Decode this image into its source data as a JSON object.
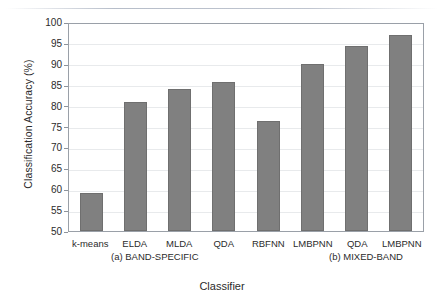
{
  "chart_data": {
    "type": "bar",
    "title": "",
    "xlabel": "Classifier",
    "ylabel": "Classification Accuracy (%)",
    "ylim": [
      50,
      100
    ],
    "ytick_step": 5,
    "yticks": [
      100,
      95,
      90,
      85,
      80,
      75,
      70,
      65,
      60,
      55,
      50
    ],
    "grid": true,
    "legend": "none",
    "bar_color": "#808080",
    "bar_edge_color": "#6f6f6f",
    "categories": [
      "k-means",
      "ELDA",
      "MLDA",
      "QDA",
      "RBFNN",
      "LMBPNN",
      "QDA",
      "LMBPNN"
    ],
    "values": [
      59.2,
      81.2,
      84.4,
      85.9,
      76.6,
      90.3,
      94.6,
      97.4
    ],
    "groups": [
      {
        "label": "(a) BAND-SPECIFIC",
        "categories": [
          "k-means",
          "ELDA",
          "MLDA",
          "QDA",
          "RBFNN",
          "LMBPNN"
        ]
      },
      {
        "label": "(b) MIXED-BAND",
        "categories": [
          "QDA",
          "LMBPNN"
        ]
      }
    ]
  },
  "axis": {
    "ylabel": "Classification Accuracy (%)",
    "xlabel": "Classifier"
  }
}
